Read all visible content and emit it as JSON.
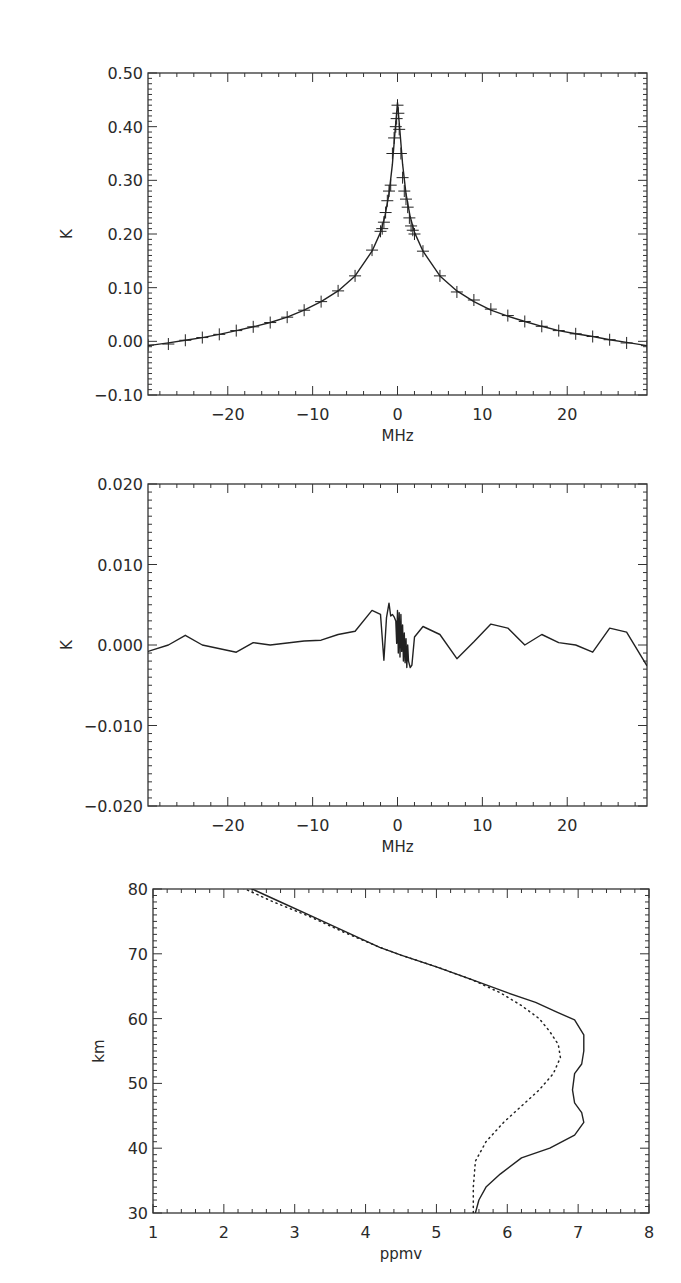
{
  "chart_data": [
    {
      "type": "scatter",
      "title": "",
      "xlabel": "MHz",
      "ylabel": "K",
      "xlim": [
        -29.4,
        29.4
      ],
      "ylim": [
        -0.1,
        0.5
      ],
      "grid": false,
      "xticks": [
        -20,
        -10,
        0,
        10,
        20
      ],
      "xtick_labels": [
        "−20",
        "−10",
        "0",
        "10",
        "20"
      ],
      "yticks": [
        -0.1,
        0.0,
        0.1,
        0.2,
        0.3,
        0.4,
        0.5
      ],
      "ytick_labels": [
        "−0.10",
        "0.00",
        "0.10",
        "0.20",
        "0.30",
        "0.40",
        "0.50"
      ],
      "x_minor_step": 2,
      "y_minor_step": 0.01,
      "frame": {
        "left": 148,
        "top": 73,
        "right": 647,
        "bottom": 395
      },
      "series": [
        {
          "name": "measured spectrum (markers)",
          "style": "plus",
          "x": [
            -29.4,
            -27,
            -25,
            -23,
            -21,
            -19,
            -17,
            -15,
            -13,
            -11,
            -9,
            -7,
            -5,
            -3,
            -2,
            -1.8,
            -1.6,
            -1.4,
            -1.2,
            -1.0,
            -0.8,
            -0.6,
            -0.4,
            -0.2,
            -0.1,
            0,
            0.1,
            0.2,
            0.4,
            0.6,
            0.8,
            1.0,
            1.2,
            1.4,
            1.6,
            1.8,
            2,
            3,
            5,
            7,
            9,
            11,
            13,
            15,
            17,
            19,
            21,
            23,
            25,
            27,
            29.4
          ],
          "y": [
            -0.007,
            -0.005,
            0.002,
            0.007,
            0.013,
            0.02,
            0.027,
            0.035,
            0.045,
            0.058,
            0.074,
            0.094,
            0.122,
            0.17,
            0.205,
            0.21,
            0.222,
            0.24,
            0.262,
            0.28,
            0.291,
            0.35,
            0.379,
            0.4,
            0.415,
            0.44,
            0.425,
            0.395,
            0.35,
            0.305,
            0.28,
            0.265,
            0.25,
            0.23,
            0.215,
            0.207,
            0.2,
            0.168,
            0.122,
            0.092,
            0.077,
            0.06,
            0.048,
            0.037,
            0.028,
            0.02,
            0.014,
            0.009,
            0.003,
            -0.003,
            -0.008
          ]
        },
        {
          "name": "fitted model (line)",
          "style": "solid",
          "x": [
            -29.4,
            -27,
            -25,
            -23,
            -21,
            -19,
            -17,
            -15,
            -13,
            -11,
            -9,
            -7,
            -5,
            -3,
            -2,
            -1.5,
            -1,
            -0.6,
            -0.3,
            0,
            0.3,
            0.6,
            1,
            1.5,
            2,
            3,
            5,
            7,
            9,
            11,
            13,
            15,
            17,
            19,
            21,
            23,
            25,
            27,
            29.4
          ],
          "y": [
            -0.008,
            -0.003,
            0.002,
            0.007,
            0.013,
            0.02,
            0.027,
            0.035,
            0.045,
            0.058,
            0.074,
            0.094,
            0.122,
            0.168,
            0.203,
            0.232,
            0.275,
            0.33,
            0.39,
            0.445,
            0.39,
            0.33,
            0.275,
            0.232,
            0.203,
            0.168,
            0.122,
            0.094,
            0.074,
            0.058,
            0.047,
            0.037,
            0.028,
            0.02,
            0.014,
            0.009,
            0.003,
            -0.002,
            -0.008
          ]
        }
      ]
    },
    {
      "type": "line",
      "title": "",
      "xlabel": "MHz",
      "ylabel": "K",
      "xlim": [
        -29.4,
        29.4
      ],
      "ylim": [
        -0.02,
        0.02
      ],
      "grid": false,
      "xticks": [
        -20,
        -10,
        0,
        10,
        20
      ],
      "xtick_labels": [
        "−20",
        "−10",
        "0",
        "10",
        "20"
      ],
      "yticks": [
        -0.02,
        -0.01,
        0.0,
        0.01,
        0.02
      ],
      "ytick_labels": [
        "−0.020",
        "−0.010",
        "0.000",
        "0.010",
        "0.020"
      ],
      "x_minor_step": 2,
      "y_minor_step": 0.001,
      "frame": {
        "left": 148,
        "top": 484,
        "right": 647,
        "bottom": 806
      },
      "series": [
        {
          "name": "residual",
          "style": "solid",
          "x": [
            -29.4,
            -27,
            -25,
            -23,
            -19,
            -17,
            -15,
            -11,
            -9,
            -7,
            -5,
            -3,
            -2,
            -1.6,
            -1.3,
            -1.0,
            -0.8,
            -0.6,
            -0.4,
            -0.2,
            -0.1,
            0,
            0.1,
            0.2,
            0.3,
            0.4,
            0.5,
            0.6,
            0.7,
            0.8,
            0.9,
            1.0,
            1.1,
            1.2,
            1.3,
            1.5,
            1.7,
            2,
            3,
            5,
            7,
            9,
            11,
            13,
            15,
            17,
            19,
            21,
            23,
            25,
            27,
            29.4
          ],
          "y": [
            -0.0008,
            0.0,
            0.0012,
            0.0,
            -0.0009,
            0.0003,
            0.0,
            0.0005,
            0.0006,
            0.0013,
            0.0017,
            0.0043,
            0.0038,
            -0.0019,
            0.0034,
            0.0052,
            0.0036,
            0.0038,
            0.0035,
            0.003,
            0.0002,
            0.0043,
            -0.001,
            0.004,
            -0.0015,
            0.0038,
            -0.0008,
            0.0025,
            -0.002,
            0.0015,
            -0.0022,
            0.0008,
            -0.0028,
            0.0,
            -0.002,
            -0.0028,
            -0.0025,
            0.001,
            0.0023,
            0.0013,
            -0.0017,
            0.0004,
            0.0026,
            0.0021,
            0.0,
            0.0013,
            0.0003,
            0.0,
            -0.0009,
            0.0021,
            0.0016,
            -0.0026
          ]
        }
      ]
    },
    {
      "type": "line",
      "title": "",
      "xlabel": "ppmv",
      "ylabel": "km",
      "xlim": [
        1,
        8
      ],
      "ylim": [
        30,
        80
      ],
      "grid": false,
      "xticks": [
        1,
        2,
        3,
        4,
        5,
        6,
        7,
        8
      ],
      "xtick_labels": [
        "1",
        "2",
        "3",
        "4",
        "5",
        "6",
        "7",
        "8"
      ],
      "yticks": [
        30,
        40,
        50,
        60,
        70,
        80
      ],
      "ytick_labels": [
        "30",
        "40",
        "50",
        "60",
        "70",
        "80"
      ],
      "x_minor_step": 0.2,
      "y_minor_step": 1,
      "frame": {
        "left": 153,
        "top": 889,
        "right": 649,
        "bottom": 1213
      },
      "series": [
        {
          "name": "retrieved profile",
          "style": "solid",
          "x": [
            2.3,
            2.8,
            3.3,
            3.8,
            4.2,
            4.5,
            5.0,
            5.5,
            6.0,
            6.4,
            6.7,
            6.95,
            7.08,
            7.08,
            7.05,
            6.95,
            6.92,
            6.95,
            7.05,
            7.08,
            6.95,
            6.6,
            6.2,
            5.9,
            5.7,
            5.6,
            5.55
          ],
          "y": [
            80.5,
            78,
            75.5,
            73,
            71,
            69.8,
            68,
            66,
            64,
            62.5,
            61,
            59.8,
            57.5,
            55,
            53,
            51.5,
            49,
            47,
            45.5,
            44,
            42,
            40,
            38.5,
            36,
            34,
            32,
            30
          ]
        },
        {
          "name": "a priori profile",
          "style": "dotted",
          "x": [
            2.2,
            2.7,
            3.2,
            3.7,
            4.2,
            4.5,
            5.0,
            5.5,
            5.9,
            6.2,
            6.45,
            6.6,
            6.72,
            6.75,
            6.65,
            6.45,
            6.2,
            5.95,
            5.7,
            5.55,
            5.52,
            5.52
          ],
          "y": [
            80.5,
            78,
            75.8,
            73.3,
            71,
            69.8,
            68,
            66,
            64,
            62,
            60,
            58,
            56,
            54,
            51.5,
            49,
            46.5,
            44,
            41,
            38,
            34,
            30
          ]
        }
      ]
    }
  ]
}
